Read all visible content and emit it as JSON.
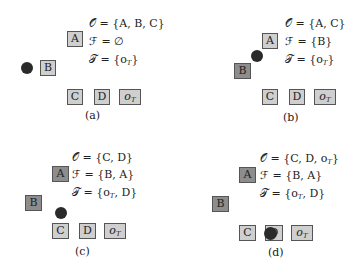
{
  "panels": [
    {
      "id": "a",
      "caption": "(a)",
      "O": "𝒪 = {A, B, C}",
      "F": "ℱ = ∅",
      "T": "𝒯 = {o",
      "T_tail": "}",
      "T_extra": "",
      "boxes": {
        "A": "A",
        "B": "B",
        "C": "C",
        "D": "D",
        "oT": "o"
      },
      "oT_sub": "T",
      "T_sub": "T"
    },
    {
      "id": "b",
      "caption": "(b)",
      "O": "𝒪 = {A, C}",
      "F": "ℱ = {B}",
      "T": "𝒯 = {o",
      "T_tail": "}",
      "T_extra": "",
      "boxes": {
        "A": "A",
        "B": "B",
        "C": "C",
        "D": "D",
        "oT": "o"
      },
      "oT_sub": "T",
      "T_sub": "T"
    },
    {
      "id": "c",
      "caption": "(c)",
      "O": "𝒪 = {C, D}",
      "F": "ℱ = {B, A}",
      "T": "𝒯 = {o",
      "T_tail": ", D}",
      "T_extra": "",
      "boxes": {
        "A": "A",
        "B": "B",
        "C": "C",
        "D": "D",
        "oT": "o"
      },
      "oT_sub": "T",
      "T_sub": "T"
    },
    {
      "id": "d",
      "caption": "(d)",
      "O": "𝒪 = {C, D, o",
      "O_tail": "}",
      "O_sub": "T",
      "F": "ℱ = {B, A}",
      "T": "𝒯 = {o",
      "T_tail": ", D}",
      "T_extra": "",
      "boxes": {
        "A": "A",
        "B": "B",
        "C": "C",
        "D": "D",
        "oT": "o"
      },
      "oT_sub": "T",
      "T_sub": "T"
    }
  ],
  "colors": {
    "unvisited_box": "#c9c9c9",
    "removed_box": "#8d8d8d",
    "agent_dot": "#2a2a2a"
  }
}
